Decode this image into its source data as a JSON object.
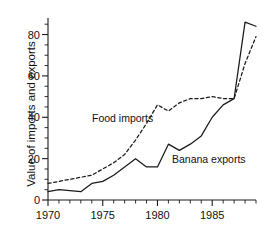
{
  "chart_data": {
    "type": "line",
    "title": "",
    "xlabel": "",
    "ylabel": "Value of imports and exports",
    "xlim": [
      1970,
      1989
    ],
    "ylim": [
      0,
      88
    ],
    "grid": false,
    "legend_position": "inline-annotations",
    "x_ticks_major": [
      1970,
      1975,
      1980,
      1985
    ],
    "x_tick_labels": [
      "1970",
      "1975",
      "1980",
      "1985"
    ],
    "x_ticks_minor_step": 1,
    "y_ticks_major": [
      0,
      20,
      40,
      60,
      80
    ],
    "y_tick_labels": [
      "0",
      "20",
      "40",
      "60",
      "80"
    ],
    "y_ticks_minor_step": 5,
    "x": [
      1970,
      1971,
      1972,
      1973,
      1974,
      1975,
      1976,
      1977,
      1978,
      1979,
      1980,
      1981,
      1982,
      1983,
      1984,
      1985,
      1986,
      1987,
      1988,
      1989
    ],
    "series": [
      {
        "name": "Food imports",
        "style": "dashed",
        "color": "#1a1a1a",
        "values": [
          8,
          9,
          10,
          11,
          12,
          15,
          18,
          22,
          29,
          37,
          46,
          43,
          47,
          49,
          49,
          50,
          49,
          49,
          66,
          79
        ]
      },
      {
        "name": "Banana exports",
        "style": "solid",
        "color": "#1a1a1a",
        "values": [
          4,
          5,
          4.5,
          4,
          8,
          9,
          12,
          16,
          20,
          16,
          16,
          27,
          24,
          27,
          31,
          40,
          46,
          49,
          86,
          84
        ]
      }
    ],
    "annotations": [
      {
        "text": "Food imports",
        "x_px": 92,
        "y_px": 112
      },
      {
        "text": "Banana exports",
        "x_px": 172,
        "y_px": 153
      }
    ],
    "axis_pixels": {
      "left": 48,
      "right": 256,
      "top": 18,
      "bottom": 200
    }
  }
}
